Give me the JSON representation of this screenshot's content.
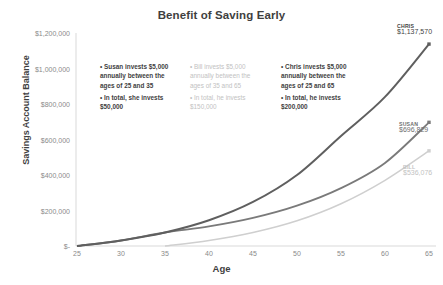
{
  "chart_data": {
    "type": "line",
    "title": "Benefit of Saving Early",
    "xlabel": "Age",
    "ylabel": "Savings Account Balance",
    "xlim": [
      25,
      65
    ],
    "ylim": [
      0,
      1200000
    ],
    "grid": false,
    "legend_position": "none",
    "x_ticks": [
      "25",
      "30",
      "35",
      "40",
      "45",
      "50",
      "55",
      "60",
      "65"
    ],
    "x_tick_values": [
      25,
      30,
      35,
      40,
      45,
      50,
      55,
      60,
      65
    ],
    "y_ticks": [
      "$-",
      "$200,000",
      "$400,000",
      "$600,000",
      "$800,000",
      "$1,000,000",
      "$1,200,000"
    ],
    "y_tick_values": [
      0,
      200000,
      400000,
      600000,
      800000,
      1000000,
      1200000
    ],
    "x": [
      25,
      30,
      35,
      40,
      45,
      50,
      55,
      60,
      65
    ],
    "series": [
      {
        "name": "Chris",
        "color": "#5f5f5f",
        "end_value": 1137570,
        "end_label_name": "CHRIS",
        "end_label_value": "$1,137,570",
        "values": [
          0,
          31000,
          76000,
          145000,
          248000,
          400000,
          620000,
          840000,
          1137570
        ]
      },
      {
        "name": "Susan",
        "color": "#7a7a7a",
        "end_value": 696829,
        "end_label_name": "SUSAN",
        "end_label_value": "$696,829",
        "values": [
          0,
          31000,
          76000,
          110000,
          158000,
          227000,
          326000,
          468000,
          696829
        ]
      },
      {
        "name": "Bill",
        "color": "#cfcfcf",
        "end_value": 536076,
        "end_label_name": "BILL",
        "end_label_value": "$536,076",
        "values": [
          null,
          null,
          0,
          31000,
          76000,
          142000,
          238000,
          370000,
          536076
        ]
      }
    ],
    "annotations": [
      {
        "id": "susan",
        "emphasis": "strong",
        "line1": "• Susan invests $5,000\nannually between the\nages of 25 and 35",
        "line2": "• In total, she invests\n$50,000"
      },
      {
        "id": "bill",
        "emphasis": "faint",
        "line1": "• Bill invests $5,000\nannually between the\nages of 35 and 65",
        "line2": "• In total, he invests\n$150,000"
      },
      {
        "id": "chris",
        "emphasis": "strong",
        "line1": "• Chris invests $5,000\nannually between the\nages of 25 and 65",
        "line2": "• In total, he invests\n$200,000"
      }
    ]
  }
}
